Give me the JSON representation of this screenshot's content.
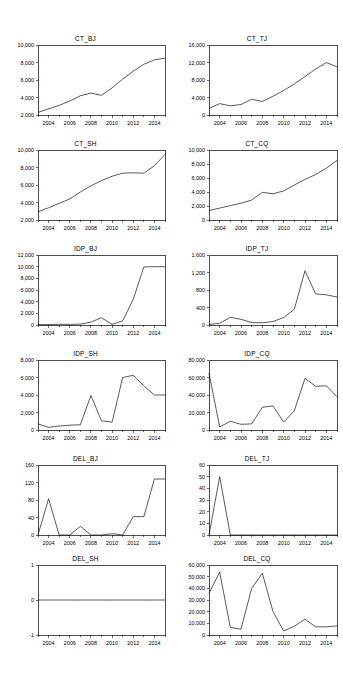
{
  "figure": {
    "kind": "small-multiples-time-series",
    "columns": 2,
    "rows": 6,
    "background": "#ffffff",
    "line_color": "#000000",
    "axis_color": "#000000"
  },
  "chart_data": [
    {
      "type": "line",
      "title": "CT_BJ",
      "xlabel": "",
      "ylabel": "",
      "grid": false,
      "legend": "none",
      "xlim": [
        2003,
        2015
      ],
      "ylim": [
        2000,
        10000
      ],
      "yticks": [
        2000,
        4000,
        6000,
        8000,
        10000
      ],
      "yticklabels": [
        "2,000",
        "4,000",
        "6,000",
        "8,000",
        "10,000"
      ],
      "xticks": [
        2004,
        2006,
        2008,
        2010,
        2012,
        2014
      ],
      "xticklabels": [
        "2004",
        "2006",
        "2008",
        "2010",
        "2012",
        "2014"
      ],
      "x": [
        2003,
        2004,
        2005,
        2006,
        2007,
        2008,
        2009,
        2010,
        2011,
        2012,
        2013,
        2014,
        2015
      ],
      "values": [
        2300,
        2700,
        3100,
        3600,
        4200,
        4500,
        4250,
        5100,
        6100,
        7000,
        7800,
        8300,
        8500
      ]
    },
    {
      "type": "line",
      "title": "CT_TJ",
      "xlabel": "",
      "ylabel": "",
      "grid": false,
      "legend": "none",
      "xlim": [
        2003,
        2015
      ],
      "ylim": [
        0,
        16000
      ],
      "yticks": [
        0,
        4000,
        8000,
        12000,
        16000
      ],
      "yticklabels": [
        "0",
        "4,000",
        "8,000",
        "12,000",
        "16,000"
      ],
      "xticks": [
        2004,
        2006,
        2008,
        2010,
        2012,
        2014
      ],
      "xticklabels": [
        "2004",
        "2006",
        "2008",
        "2010",
        "2012",
        "2014"
      ],
      "x": [
        2003,
        2004,
        2005,
        2006,
        2007,
        2008,
        2009,
        2010,
        2011,
        2012,
        2013,
        2014,
        2015
      ],
      "values": [
        1500,
        2600,
        2100,
        2400,
        3600,
        3100,
        4300,
        5600,
        7100,
        8800,
        10500,
        12000,
        11000
      ]
    },
    {
      "type": "line",
      "title": "CT_SH",
      "xlabel": "",
      "ylabel": "",
      "grid": false,
      "legend": "none",
      "xlim": [
        2003,
        2015
      ],
      "ylim": [
        2000,
        10000
      ],
      "yticks": [
        2000,
        4000,
        6000,
        8000,
        10000
      ],
      "yticklabels": [
        "2,000",
        "4,000",
        "6,000",
        "8,000",
        "10,000"
      ],
      "xticks": [
        2004,
        2006,
        2008,
        2010,
        2012,
        2014
      ],
      "xticklabels": [
        "2004",
        "2006",
        "2008",
        "2010",
        "2012",
        "2014"
      ],
      "x": [
        2003,
        2004,
        2005,
        2006,
        2007,
        2008,
        2009,
        2010,
        2011,
        2012,
        2013,
        2014,
        2015
      ],
      "values": [
        2950,
        3400,
        3900,
        4400,
        5200,
        5900,
        6500,
        7000,
        7350,
        7400,
        7350,
        8200,
        9500
      ]
    },
    {
      "type": "line",
      "title": "CT_CQ",
      "xlabel": "",
      "ylabel": "",
      "grid": false,
      "legend": "none",
      "xlim": [
        2003,
        2015
      ],
      "ylim": [
        0,
        10000
      ],
      "yticks": [
        0,
        2000,
        4000,
        6000,
        8000,
        10000
      ],
      "yticklabels": [
        "0",
        "2,000",
        "4,000",
        "6,000",
        "8,000",
        "10,000"
      ],
      "xticks": [
        2004,
        2006,
        2008,
        2010,
        2012,
        2014
      ],
      "xticklabels": [
        "2004",
        "2006",
        "2008",
        "2010",
        "2012",
        "2014"
      ],
      "x": [
        2003,
        2004,
        2005,
        2006,
        2007,
        2008,
        2009,
        2010,
        2011,
        2012,
        2013,
        2014,
        2015
      ],
      "values": [
        1350,
        1700,
        2050,
        2400,
        2850,
        3950,
        3750,
        4150,
        5000,
        5800,
        6500,
        7400,
        8500
      ]
    },
    {
      "type": "line",
      "title": "IDP_BJ",
      "xlabel": "",
      "ylabel": "",
      "grid": false,
      "legend": "none",
      "xlim": [
        2003,
        2015
      ],
      "ylim": [
        0,
        12000
      ],
      "yticks": [
        0,
        2000,
        4000,
        6000,
        8000,
        10000,
        12000
      ],
      "yticklabels": [
        "0",
        "2,000",
        "4,000",
        "6,000",
        "8,000",
        "10,000",
        "12,000"
      ],
      "xticks": [
        2004,
        2006,
        2008,
        2010,
        2012,
        2014
      ],
      "xticklabels": [
        "2004",
        "2006",
        "2008",
        "2010",
        "2012",
        "2014"
      ],
      "x": [
        2003,
        2004,
        2005,
        2006,
        2007,
        2008,
        2009,
        2010,
        2011,
        2012,
        2013,
        2014,
        2015
      ],
      "values": [
        60,
        80,
        120,
        100,
        150,
        500,
        1250,
        100,
        700,
        4400,
        9950,
        10000,
        10000
      ]
    },
    {
      "type": "line",
      "title": "IDP_TJ",
      "xlabel": "",
      "ylabel": "",
      "grid": false,
      "legend": "none",
      "xlim": [
        2003,
        2015
      ],
      "ylim": [
        0,
        1600
      ],
      "yticks": [
        0,
        400,
        800,
        1200,
        1600
      ],
      "yticklabels": [
        "0",
        "400",
        "800",
        "1,200",
        "1,600"
      ],
      "xticks": [
        2004,
        2006,
        2008,
        2010,
        2012,
        2014
      ],
      "xticklabels": [
        "2004",
        "2006",
        "2008",
        "2010",
        "2012",
        "2014"
      ],
      "x": [
        2003,
        2004,
        2005,
        2006,
        2007,
        2008,
        2009,
        2010,
        2011,
        2012,
        2013,
        2014,
        2015
      ],
      "values": [
        10,
        40,
        175,
        130,
        55,
        50,
        80,
        170,
        360,
        1240,
        710,
        690,
        640
      ]
    },
    {
      "type": "line",
      "title": "IDP_SH",
      "xlabel": "",
      "ylabel": "",
      "grid": false,
      "legend": "none",
      "xlim": [
        2003,
        2015
      ],
      "ylim": [
        0,
        8000
      ],
      "yticks": [
        0,
        2000,
        4000,
        6000,
        8000
      ],
      "yticklabels": [
        "0",
        "2,000",
        "4,000",
        "6,000",
        "8,000"
      ],
      "xticks": [
        2004,
        2006,
        2008,
        2010,
        2012,
        2014
      ],
      "xticklabels": [
        "2004",
        "2006",
        "2008",
        "2010",
        "2012",
        "2014"
      ],
      "x": [
        2003,
        2004,
        2005,
        2006,
        2007,
        2008,
        2009,
        2010,
        2011,
        2012,
        2013,
        2014,
        2015
      ],
      "values": [
        700,
        300,
        450,
        550,
        600,
        3950,
        1050,
        900,
        6000,
        6250,
        5050,
        4000,
        4000
      ]
    },
    {
      "type": "line",
      "title": "IDP_CQ",
      "xlabel": "",
      "ylabel": "",
      "grid": false,
      "legend": "none",
      "xlim": [
        2003,
        2015
      ],
      "ylim": [
        0,
        80000
      ],
      "yticks": [
        0,
        20000,
        40000,
        60000,
        80000
      ],
      "yticklabels": [
        "0",
        "20,000",
        "40,000",
        "60,000",
        "80,000"
      ],
      "xticks": [
        2004,
        2006,
        2008,
        2010,
        2012,
        2014
      ],
      "xticklabels": [
        "2004",
        "2006",
        "2008",
        "2010",
        "2012",
        "2014"
      ],
      "x": [
        2003,
        2004,
        2005,
        2006,
        2007,
        2008,
        2009,
        2010,
        2011,
        2012,
        2013,
        2014,
        2015
      ],
      "values": [
        65000,
        3500,
        10000,
        6500,
        7000,
        26000,
        27500,
        9000,
        22000,
        59000,
        50000,
        50500,
        38000
      ]
    },
    {
      "type": "line",
      "title": "DEL_BJ",
      "xlabel": "",
      "ylabel": "",
      "grid": false,
      "legend": "none",
      "xlim": [
        2003,
        2015
      ],
      "ylim": [
        0,
        160
      ],
      "yticks": [
        0,
        40,
        80,
        120,
        160
      ],
      "yticklabels": [
        "0",
        "40",
        "80",
        "120",
        "160"
      ],
      "xticks": [
        2004,
        2006,
        2008,
        2010,
        2012,
        2014
      ],
      "xticklabels": [
        "2004",
        "2006",
        "2008",
        "2010",
        "2012",
        "2014"
      ],
      "x": [
        2003,
        2004,
        2005,
        2006,
        2007,
        2008,
        2009,
        2010,
        2011,
        2012,
        2013,
        2014,
        2015
      ],
      "values": [
        0,
        83,
        0,
        0,
        20,
        0,
        0,
        3,
        0,
        42,
        42,
        128,
        128
      ]
    },
    {
      "type": "line",
      "title": "DEL_TJ",
      "xlabel": "",
      "ylabel": "",
      "grid": false,
      "legend": "none",
      "xlim": [
        2003,
        2015
      ],
      "ylim": [
        0,
        60
      ],
      "yticks": [
        0,
        10,
        20,
        30,
        40,
        50,
        60
      ],
      "yticklabels": [
        "0",
        "10",
        "20",
        "30",
        "40",
        "50",
        "60"
      ],
      "xticks": [
        2004,
        2006,
        2008,
        2010,
        2012,
        2014
      ],
      "xticklabels": [
        "2004",
        "2006",
        "2008",
        "2010",
        "2012",
        "2014"
      ],
      "x": [
        2003,
        2004,
        2005,
        2006,
        2007,
        2008,
        2009,
        2010,
        2011,
        2012,
        2013,
        2014,
        2015
      ],
      "values": [
        0,
        50,
        0,
        0,
        0,
        0,
        0,
        0,
        0,
        0,
        0,
        0,
        0
      ]
    },
    {
      "type": "line",
      "title": "DEL_SH",
      "xlabel": "",
      "ylabel": "",
      "grid": false,
      "legend": "none",
      "xlim": [
        2003,
        2015
      ],
      "ylim": [
        -1,
        1
      ],
      "yticks": [
        -1,
        0,
        1
      ],
      "yticklabels": [
        "-1",
        "0",
        "1"
      ],
      "xticks": [
        2004,
        2006,
        2008,
        2010,
        2012,
        2014
      ],
      "xticklabels": [
        "2004",
        "2006",
        "2008",
        "2010",
        "2012",
        "2014"
      ],
      "x": [
        2003,
        2004,
        2005,
        2006,
        2007,
        2008,
        2009,
        2010,
        2011,
        2012,
        2013,
        2014,
        2015
      ],
      "values": [
        0,
        0,
        0,
        0,
        0,
        0,
        0,
        0,
        0,
        0,
        0,
        0,
        0
      ]
    },
    {
      "type": "line",
      "title": "DEL_CQ",
      "xlabel": "",
      "ylabel": "",
      "grid": false,
      "legend": "none",
      "xlim": [
        2003,
        2015
      ],
      "ylim": [
        0,
        60000
      ],
      "yticks": [
        0,
        10000,
        20000,
        30000,
        40000,
        50000,
        60000
      ],
      "yticklabels": [
        "0",
        "10,000",
        "20,000",
        "30,000",
        "40,000",
        "50,000",
        "60,000"
      ],
      "xticks": [
        2004,
        2006,
        2008,
        2010,
        2012,
        2014
      ],
      "xticklabels": [
        "2004",
        "2006",
        "2008",
        "2010",
        "2012",
        "2014"
      ],
      "x": [
        2003,
        2004,
        2005,
        2006,
        2007,
        2008,
        2009,
        2010,
        2011,
        2012,
        2013,
        2014,
        2015
      ],
      "values": [
        35500,
        54000,
        6500,
        5000,
        40000,
        53000,
        20000,
        3500,
        7500,
        13500,
        7000,
        7000,
        7800
      ]
    }
  ]
}
